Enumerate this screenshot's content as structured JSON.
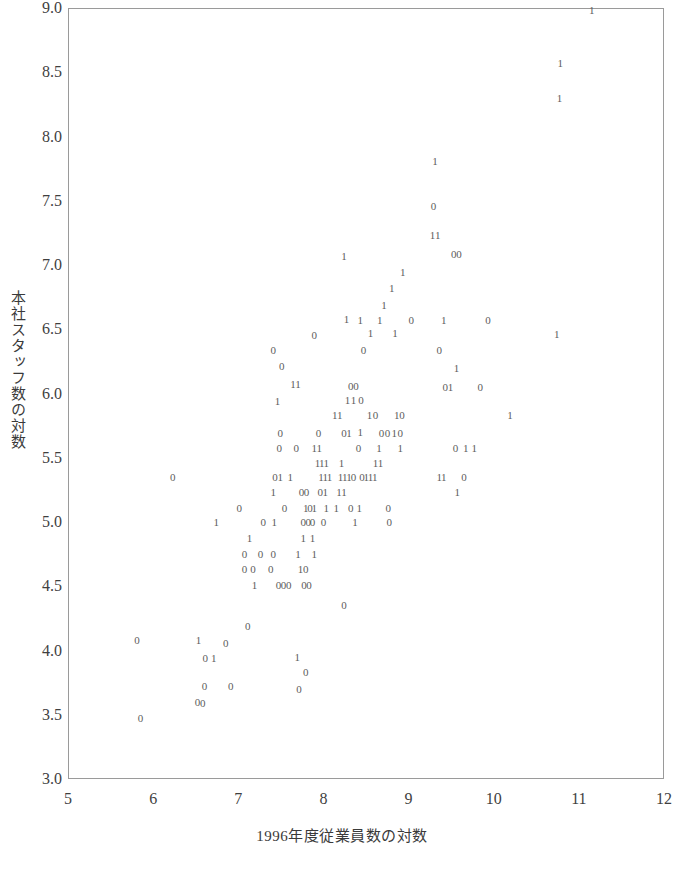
{
  "chart_data": {
    "type": "scatter",
    "title": "",
    "xlabel": "1996年度従業員数の対数",
    "ylabel": "本社スタッフ数の対数",
    "xlim": [
      5,
      12
    ],
    "ylim": [
      3.0,
      9.0
    ],
    "xticks": [
      "5",
      "6",
      "7",
      "8",
      "9",
      "10",
      "11",
      "12"
    ],
    "xtick_values": [
      5,
      6,
      7,
      8,
      9,
      10,
      11,
      12
    ],
    "yticks": [
      "9.0",
      "8.5",
      "8.0",
      "7.5",
      "7.0",
      "6.5",
      "6.0",
      "5.5",
      "5.0",
      "4.5",
      "4.0",
      "3.5",
      "3.0"
    ],
    "ytick_values": [
      9.0,
      8.5,
      8.0,
      7.5,
      7.0,
      6.5,
      6.0,
      5.5,
      5.0,
      4.5,
      4.0,
      3.5,
      3.0
    ],
    "grid": false,
    "legend": "none",
    "marker_style": "text-label",
    "marker_labels": [
      "0",
      "1"
    ],
    "marker_note": "Each point is plotted as the digit 0 or 1 denoting a group code",
    "points": [
      {
        "x": 11.14,
        "y": 8.99,
        "label": "1"
      },
      {
        "x": 10.77,
        "y": 8.58,
        "label": "1"
      },
      {
        "x": 10.76,
        "y": 8.31,
        "label": "1"
      },
      {
        "x": 9.3,
        "y": 7.82,
        "label": "1"
      },
      {
        "x": 9.28,
        "y": 7.47,
        "label": "0"
      },
      {
        "x": 9.27,
        "y": 7.24,
        "label": "1"
      },
      {
        "x": 9.33,
        "y": 7.24,
        "label": "1"
      },
      {
        "x": 8.23,
        "y": 7.08,
        "label": "1"
      },
      {
        "x": 9.52,
        "y": 7.09,
        "label": "0"
      },
      {
        "x": 9.58,
        "y": 7.09,
        "label": "0"
      },
      {
        "x": 8.92,
        "y": 6.95,
        "label": "1"
      },
      {
        "x": 8.79,
        "y": 6.83,
        "label": "1"
      },
      {
        "x": 8.7,
        "y": 6.7,
        "label": "1"
      },
      {
        "x": 8.65,
        "y": 6.58,
        "label": "1"
      },
      {
        "x": 8.42,
        "y": 6.58,
        "label": "1"
      },
      {
        "x": 8.26,
        "y": 6.59,
        "label": "1"
      },
      {
        "x": 9.02,
        "y": 6.58,
        "label": "0"
      },
      {
        "x": 9.4,
        "y": 6.58,
        "label": "1"
      },
      {
        "x": 9.92,
        "y": 6.58,
        "label": "0"
      },
      {
        "x": 10.73,
        "y": 6.47,
        "label": "1"
      },
      {
        "x": 7.88,
        "y": 6.46,
        "label": "0"
      },
      {
        "x": 8.54,
        "y": 6.48,
        "label": "1"
      },
      {
        "x": 8.83,
        "y": 6.48,
        "label": "1"
      },
      {
        "x": 7.4,
        "y": 6.35,
        "label": "0"
      },
      {
        "x": 8.46,
        "y": 6.35,
        "label": "0"
      },
      {
        "x": 9.35,
        "y": 6.35,
        "label": "0"
      },
      {
        "x": 7.5,
        "y": 6.22,
        "label": "0"
      },
      {
        "x": 9.55,
        "y": 6.21,
        "label": "1"
      },
      {
        "x": 7.63,
        "y": 6.08,
        "label": "1"
      },
      {
        "x": 7.69,
        "y": 6.08,
        "label": "1"
      },
      {
        "x": 8.31,
        "y": 6.07,
        "label": "0"
      },
      {
        "x": 8.37,
        "y": 6.07,
        "label": "0"
      },
      {
        "x": 9.42,
        "y": 6.06,
        "label": "0"
      },
      {
        "x": 9.48,
        "y": 6.06,
        "label": "1"
      },
      {
        "x": 9.83,
        "y": 6.06,
        "label": "0"
      },
      {
        "x": 7.45,
        "y": 5.95,
        "label": "1"
      },
      {
        "x": 8.27,
        "y": 5.96,
        "label": "1"
      },
      {
        "x": 8.34,
        "y": 5.96,
        "label": "1"
      },
      {
        "x": 8.43,
        "y": 5.96,
        "label": "0"
      },
      {
        "x": 8.12,
        "y": 5.84,
        "label": "1"
      },
      {
        "x": 8.18,
        "y": 5.84,
        "label": "1"
      },
      {
        "x": 8.53,
        "y": 5.84,
        "label": "1"
      },
      {
        "x": 8.6,
        "y": 5.84,
        "label": "0"
      },
      {
        "x": 8.85,
        "y": 5.84,
        "label": "1"
      },
      {
        "x": 8.91,
        "y": 5.84,
        "label": "0"
      },
      {
        "x": 10.18,
        "y": 5.84,
        "label": "1"
      },
      {
        "x": 7.48,
        "y": 5.7,
        "label": "0"
      },
      {
        "x": 7.93,
        "y": 5.7,
        "label": "0"
      },
      {
        "x": 8.23,
        "y": 5.7,
        "label": "0"
      },
      {
        "x": 8.29,
        "y": 5.7,
        "label": "1"
      },
      {
        "x": 8.42,
        "y": 5.71,
        "label": "1"
      },
      {
        "x": 8.67,
        "y": 5.7,
        "label": "0"
      },
      {
        "x": 8.74,
        "y": 5.7,
        "label": "0"
      },
      {
        "x": 8.82,
        "y": 5.7,
        "label": "1"
      },
      {
        "x": 8.89,
        "y": 5.7,
        "label": "0"
      },
      {
        "x": 7.47,
        "y": 5.58,
        "label": "0"
      },
      {
        "x": 7.67,
        "y": 5.58,
        "label": "0"
      },
      {
        "x": 7.88,
        "y": 5.58,
        "label": "1"
      },
      {
        "x": 7.94,
        "y": 5.58,
        "label": "1"
      },
      {
        "x": 8.4,
        "y": 5.58,
        "label": "0"
      },
      {
        "x": 8.64,
        "y": 5.58,
        "label": "1"
      },
      {
        "x": 8.89,
        "y": 5.58,
        "label": "1"
      },
      {
        "x": 9.54,
        "y": 5.58,
        "label": "0"
      },
      {
        "x": 9.66,
        "y": 5.58,
        "label": "1"
      },
      {
        "x": 9.76,
        "y": 5.58,
        "label": "1"
      },
      {
        "x": 7.92,
        "y": 5.47,
        "label": "1"
      },
      {
        "x": 7.97,
        "y": 5.47,
        "label": "1"
      },
      {
        "x": 8.02,
        "y": 5.47,
        "label": "1"
      },
      {
        "x": 8.2,
        "y": 5.47,
        "label": "1"
      },
      {
        "x": 8.6,
        "y": 5.47,
        "label": "1"
      },
      {
        "x": 8.66,
        "y": 5.47,
        "label": "1"
      },
      {
        "x": 6.22,
        "y": 5.36,
        "label": "0"
      },
      {
        "x": 7.42,
        "y": 5.36,
        "label": "0"
      },
      {
        "x": 7.48,
        "y": 5.36,
        "label": "1"
      },
      {
        "x": 7.6,
        "y": 5.36,
        "label": "1"
      },
      {
        "x": 7.96,
        "y": 5.36,
        "label": "1"
      },
      {
        "x": 8.01,
        "y": 5.36,
        "label": "1"
      },
      {
        "x": 8.06,
        "y": 5.36,
        "label": "1"
      },
      {
        "x": 8.19,
        "y": 5.36,
        "label": "1"
      },
      {
        "x": 8.24,
        "y": 5.36,
        "label": "1"
      },
      {
        "x": 8.29,
        "y": 5.36,
        "label": "1"
      },
      {
        "x": 8.34,
        "y": 5.36,
        "label": "0"
      },
      {
        "x": 8.44,
        "y": 5.36,
        "label": "0"
      },
      {
        "x": 8.49,
        "y": 5.36,
        "label": "1"
      },
      {
        "x": 8.54,
        "y": 5.36,
        "label": "1"
      },
      {
        "x": 8.59,
        "y": 5.36,
        "label": "1"
      },
      {
        "x": 9.35,
        "y": 5.36,
        "label": "1"
      },
      {
        "x": 9.4,
        "y": 5.36,
        "label": "1"
      },
      {
        "x": 9.64,
        "y": 5.36,
        "label": "0"
      },
      {
        "x": 7.4,
        "y": 5.24,
        "label": "1"
      },
      {
        "x": 7.73,
        "y": 5.24,
        "label": "0"
      },
      {
        "x": 7.79,
        "y": 5.24,
        "label": "0"
      },
      {
        "x": 7.95,
        "y": 5.24,
        "label": "0"
      },
      {
        "x": 8.01,
        "y": 5.24,
        "label": "1"
      },
      {
        "x": 8.17,
        "y": 5.24,
        "label": "1"
      },
      {
        "x": 8.23,
        "y": 5.24,
        "label": "1"
      },
      {
        "x": 9.56,
        "y": 5.24,
        "label": "1"
      },
      {
        "x": 7.0,
        "y": 5.12,
        "label": "0"
      },
      {
        "x": 7.53,
        "y": 5.12,
        "label": "0"
      },
      {
        "x": 7.78,
        "y": 5.12,
        "label": "1"
      },
      {
        "x": 7.83,
        "y": 5.12,
        "label": "0"
      },
      {
        "x": 7.88,
        "y": 5.12,
        "label": "1"
      },
      {
        "x": 8.02,
        "y": 5.12,
        "label": "1"
      },
      {
        "x": 8.14,
        "y": 5.12,
        "label": "1"
      },
      {
        "x": 8.31,
        "y": 5.12,
        "label": "0"
      },
      {
        "x": 8.41,
        "y": 5.12,
        "label": "1"
      },
      {
        "x": 8.75,
        "y": 5.12,
        "label": "0"
      },
      {
        "x": 6.73,
        "y": 5.01,
        "label": "1"
      },
      {
        "x": 7.28,
        "y": 5.01,
        "label": "0"
      },
      {
        "x": 7.41,
        "y": 5.01,
        "label": "1"
      },
      {
        "x": 7.75,
        "y": 5.01,
        "label": "0"
      },
      {
        "x": 7.81,
        "y": 5.01,
        "label": "0"
      },
      {
        "x": 7.86,
        "y": 5.01,
        "label": "0"
      },
      {
        "x": 7.99,
        "y": 5.01,
        "label": "0"
      },
      {
        "x": 8.36,
        "y": 5.01,
        "label": "1"
      },
      {
        "x": 8.76,
        "y": 5.01,
        "label": "0"
      },
      {
        "x": 7.12,
        "y": 4.88,
        "label": "1"
      },
      {
        "x": 7.75,
        "y": 4.88,
        "label": "1"
      },
      {
        "x": 7.86,
        "y": 4.88,
        "label": "1"
      },
      {
        "x": 7.06,
        "y": 4.76,
        "label": "0"
      },
      {
        "x": 7.25,
        "y": 4.76,
        "label": "0"
      },
      {
        "x": 7.4,
        "y": 4.76,
        "label": "0"
      },
      {
        "x": 7.69,
        "y": 4.76,
        "label": "1"
      },
      {
        "x": 7.88,
        "y": 4.76,
        "label": "1"
      },
      {
        "x": 7.06,
        "y": 4.64,
        "label": "0"
      },
      {
        "x": 7.16,
        "y": 4.64,
        "label": "0"
      },
      {
        "x": 7.37,
        "y": 4.64,
        "label": "0"
      },
      {
        "x": 7.72,
        "y": 4.64,
        "label": "1"
      },
      {
        "x": 7.78,
        "y": 4.64,
        "label": "0"
      },
      {
        "x": 7.18,
        "y": 4.52,
        "label": "1"
      },
      {
        "x": 7.46,
        "y": 4.52,
        "label": "0"
      },
      {
        "x": 7.52,
        "y": 4.52,
        "label": "0"
      },
      {
        "x": 7.58,
        "y": 4.52,
        "label": "0"
      },
      {
        "x": 7.76,
        "y": 4.52,
        "label": "0"
      },
      {
        "x": 7.82,
        "y": 4.52,
        "label": "0"
      },
      {
        "x": 8.23,
        "y": 4.36,
        "label": "0"
      },
      {
        "x": 7.1,
        "y": 4.2,
        "label": "0"
      },
      {
        "x": 5.8,
        "y": 4.09,
        "label": "0"
      },
      {
        "x": 6.52,
        "y": 4.09,
        "label": "1"
      },
      {
        "x": 6.84,
        "y": 4.07,
        "label": "0"
      },
      {
        "x": 6.6,
        "y": 3.95,
        "label": "0"
      },
      {
        "x": 6.7,
        "y": 3.95,
        "label": "1"
      },
      {
        "x": 7.68,
        "y": 3.96,
        "label": "1"
      },
      {
        "x": 7.78,
        "y": 3.84,
        "label": "0"
      },
      {
        "x": 6.59,
        "y": 3.73,
        "label": "0"
      },
      {
        "x": 6.9,
        "y": 3.73,
        "label": "0"
      },
      {
        "x": 7.7,
        "y": 3.71,
        "label": "0"
      },
      {
        "x": 6.51,
        "y": 3.61,
        "label": "0"
      },
      {
        "x": 6.57,
        "y": 3.6,
        "label": "0"
      },
      {
        "x": 5.84,
        "y": 3.48,
        "label": "0"
      }
    ]
  },
  "caption": {
    "text": ""
  }
}
